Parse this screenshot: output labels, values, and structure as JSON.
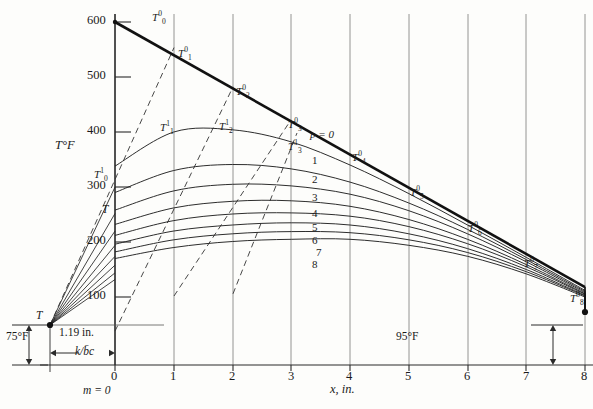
{
  "figure": {
    "y_axis_label": "T°F",
    "x_axis_label": "x, in.",
    "left_boundary_label": "T",
    "left_gap_value": "75°F",
    "right_gap_value": "95°F",
    "left_offset_distance": "1.19 in.",
    "left_offset_symbol": "k/b̄c",
    "m_label": "m = 0",
    "p_label": "p = 0"
  },
  "chart_data": {
    "type": "line",
    "title": "",
    "xlabel": "x, in.",
    "ylabel": "T°F",
    "xlim": [
      0,
      8
    ],
    "ylim": [
      75,
      620
    ],
    "xticks": [
      0,
      1,
      2,
      3,
      4,
      5,
      6,
      7,
      8
    ],
    "xticklabels": [
      "0",
      "1",
      "2",
      "3",
      "4",
      "5",
      "6",
      "7",
      "8"
    ],
    "yticks": [
      100,
      200,
      300,
      400,
      500,
      600
    ],
    "yticklabels": [
      "100",
      "200",
      "300",
      "400",
      "500",
      "600"
    ],
    "grid": "vertical",
    "legend": "inline-labels",
    "surface_left_x": -1.1,
    "surface_left_T": 75,
    "surface_right_x": 8.25,
    "surface_right_T": 95,
    "initial_profile": {
      "name": "p = 0",
      "comment": "thick straight line, initial temperature distribution",
      "points": [
        [
          0,
          600
        ],
        [
          8,
          118
        ]
      ]
    },
    "dashed_construction_lines": [
      {
        "from": [
          -1.1,
          75
        ],
        "to": [
          1,
          548
        ]
      },
      {
        "from": [
          0,
          338
        ],
        "to": [
          2,
          477
        ]
      },
      {
        "from": [
          1,
          400
        ],
        "to": [
          3,
          404
        ]
      },
      {
        "from": [
          2,
          404
        ],
        "to": [
          3.1,
          382
        ]
      }
    ],
    "series": [
      {
        "name": "p = 0",
        "values_x": [
          0,
          1,
          2,
          3,
          4,
          5,
          6,
          7,
          8
        ],
        "values_y": [
          600,
          548,
          477,
          417,
          357,
          296,
          236,
          176,
          118
        ]
      },
      {
        "name": "1",
        "values_x": [
          0,
          1,
          2,
          3,
          4,
          5,
          6,
          7,
          8
        ],
        "values_y": [
          338,
          400,
          404,
          382,
          340,
          288,
          231,
          172,
          112
        ]
      },
      {
        "name": "2",
        "values_x": [
          0,
          1,
          2,
          3,
          4,
          5,
          6,
          7,
          8
        ],
        "values_y": [
          290,
          330,
          341,
          333,
          309,
          271,
          223,
          168,
          110
        ]
      },
      {
        "name": "3",
        "values_x": [
          0,
          1,
          2,
          3,
          4,
          5,
          6,
          7,
          8
        ],
        "values_y": [
          258,
          293,
          305,
          302,
          287,
          257,
          215,
          164,
          108
        ]
      },
      {
        "name": "4",
        "values_x": [
          0,
          1,
          2,
          3,
          4,
          5,
          6,
          7,
          8
        ],
        "values_y": [
          232,
          262,
          274,
          275,
          265,
          241,
          205,
          159,
          106
        ]
      },
      {
        "name": "5",
        "values_x": [
          0,
          1,
          2,
          3,
          4,
          5,
          6,
          7,
          8
        ],
        "values_y": [
          212,
          239,
          251,
          253,
          247,
          228,
          197,
          155,
          105
        ]
      },
      {
        "name": "6",
        "values_x": [
          0,
          1,
          2,
          3,
          4,
          5,
          6,
          7,
          8
        ],
        "values_y": [
          196,
          220,
          231,
          235,
          231,
          215,
          188,
          150,
          103
        ]
      },
      {
        "name": "7",
        "values_x": [
          0,
          1,
          2,
          3,
          4,
          5,
          6,
          7,
          8
        ],
        "values_y": [
          182,
          204,
          215,
          219,
          217,
          204,
          181,
          146,
          102
        ]
      },
      {
        "name": "8",
        "values_x": [
          0,
          1,
          2,
          3,
          4,
          5,
          6,
          7,
          8
        ],
        "values_y": [
          170,
          190,
          201,
          205,
          205,
          194,
          174,
          142,
          100
        ]
      }
    ],
    "curve_labels": [
      "p = 0",
      "1",
      "2",
      "3",
      "4",
      "5",
      "6",
      "7",
      "8"
    ],
    "node_labels_top": [
      {
        "text": "T",
        "sup": "0",
        "sub": "0",
        "x": 0,
        "y": 600
      },
      {
        "text": "T",
        "sup": "0",
        "sub": "1",
        "x": 1,
        "y": 548
      },
      {
        "text": "T",
        "sup": "0",
        "sub": "2",
        "x": 2,
        "y": 477
      },
      {
        "text": "T",
        "sup": "0",
        "sub": "3",
        "x": 3,
        "y": 417
      },
      {
        "text": "T",
        "sup": "0",
        "sub": "4",
        "x": 4,
        "y": 357
      },
      {
        "text": "T",
        "sup": "0",
        "sub": "5",
        "x": 5,
        "y": 296
      },
      {
        "text": "T",
        "sup": "0",
        "sub": "6",
        "x": 6,
        "y": 236
      },
      {
        "text": "T",
        "sup": "0",
        "sub": "7",
        "x": 7,
        "y": 176
      },
      {
        "text": "T",
        "sup": "0",
        "sub": "8",
        "x": 8,
        "y": 118
      }
    ],
    "node_labels_first": [
      {
        "text": "T",
        "sup": "1",
        "sub": "0",
        "x": 0,
        "y": 338
      },
      {
        "text": "T",
        "sup": "1",
        "sub": "1",
        "x": 1,
        "y": 400
      },
      {
        "text": "T",
        "sup": "1",
        "sub": "2",
        "x": 2,
        "y": 404
      },
      {
        "text": "T",
        "sup": "1",
        "sub": "3",
        "x": 3,
        "y": 382
      }
    ],
    "misc_labels": [
      {
        "text": "T",
        "role": "left-surface-temperature"
      },
      {
        "text": "T",
        "role": "y-axis-interior-marker"
      }
    ]
  }
}
